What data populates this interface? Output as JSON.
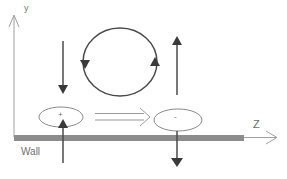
{
  "diagram": {
    "axes": {
      "y_label": "y",
      "z_label": "Z"
    },
    "wall": {
      "label": "Wall",
      "color": "#8a8a8a"
    },
    "vortex_pair": {
      "left_ellipse_sign": "+",
      "right_ellipse_sign": "-",
      "circulation": "counter-clockwise loop between arrows"
    },
    "arrows": {
      "left_down": "downward arrow above + ellipse",
      "left_up_from_wall": "upward arrow from below wall into + ellipse",
      "right_up": "upward arrow above - ellipse",
      "right_down_through_wall": "downward arrow from - ellipse through wall",
      "convection": "double-line arrow from + ellipse toward - ellipse"
    },
    "colors": {
      "line": "#4a4a4a",
      "axis": "#9a9a9a",
      "ellipse": "#8a8a8a",
      "wall_fill": "#8c8c8c"
    }
  }
}
